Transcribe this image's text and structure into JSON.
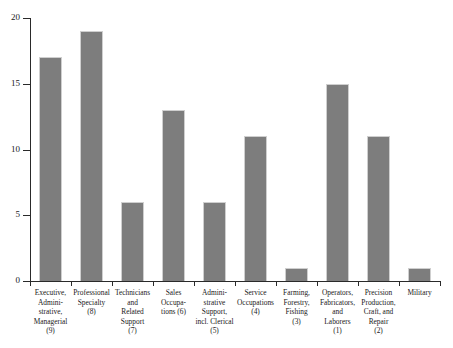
{
  "chart_data": {
    "type": "bar",
    "title": "",
    "subtitle": "",
    "xlabel": "",
    "ylabel": "",
    "ylim": [
      0,
      20
    ],
    "yticks": [
      0,
      5,
      10,
      15,
      20
    ],
    "ytick_labels": [
      "0",
      "5",
      "10",
      "15",
      "20"
    ],
    "grid": false,
    "legend": null,
    "bar_color": "#7d7d7d",
    "axis_color": "#2a2a2a",
    "background_color": "#ffffff",
    "categories": [
      "Executive,\nAdmini-\nstrative,\nManagerial\n(9)",
      "Professional\nSpecialty\n(8)",
      "Technicians\nand\nRelated\nSupport\n(7)",
      "Sales\nOccupa-\ntions (6)",
      "Admini-\nstrative\nSupport,\nincl. Clerical\n(5)",
      "Service\nOccupations\n(4)",
      "Farming,\nForestry,\nFishing\n(3)",
      "Operators,\nFabricators,\nand\nLaborers\n(1)",
      "Precision\nProduction,\nCraft, and\nRepair\n(2)",
      "Military"
    ],
    "values": [
      17,
      19,
      6,
      13,
      6,
      11,
      1,
      15,
      11,
      1
    ]
  }
}
